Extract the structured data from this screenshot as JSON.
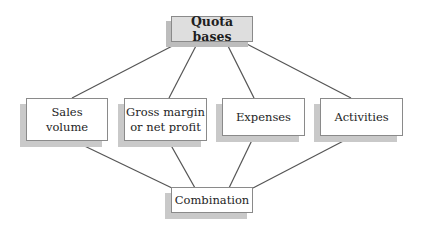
{
  "diagram": {
    "type": "hierarchy",
    "root": {
      "id": "quota-bases",
      "label": "Quota bases"
    },
    "children": [
      {
        "id": "sales-volume",
        "label": "Sales\nvolume"
      },
      {
        "id": "gross-margin",
        "label": "Gross margin\nor net profit"
      },
      {
        "id": "expenses",
        "label": "Expenses"
      },
      {
        "id": "activities",
        "label": "Activities"
      }
    ],
    "sink": {
      "id": "combination",
      "label": "Combination"
    },
    "edges": [
      [
        "quota-bases",
        "sales-volume"
      ],
      [
        "quota-bases",
        "gross-margin"
      ],
      [
        "quota-bases",
        "expenses"
      ],
      [
        "quota-bases",
        "activities"
      ],
      [
        "sales-volume",
        "combination"
      ],
      [
        "gross-margin",
        "combination"
      ],
      [
        "expenses",
        "combination"
      ],
      [
        "activities",
        "combination"
      ]
    ]
  },
  "colors": {
    "root_fill": "#dedede",
    "node_fill": "#ffffff",
    "border": "#8a8a8a",
    "shadow": "#c9c9c9",
    "line": "#555555"
  }
}
